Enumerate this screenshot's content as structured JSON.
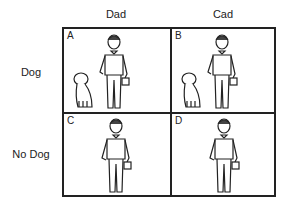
{
  "columns": [
    {
      "label": "Dad"
    },
    {
      "label": "Cad"
    }
  ],
  "rows": [
    {
      "label": "Dog"
    },
    {
      "label": "No Dog"
    }
  ],
  "cells": [
    {
      "letter": "A",
      "column": "Dad",
      "row": "Dog",
      "has_dog": true
    },
    {
      "letter": "B",
      "column": "Cad",
      "row": "Dog",
      "has_dog": true
    },
    {
      "letter": "C",
      "column": "Dad",
      "row": "No Dog",
      "has_dog": false
    },
    {
      "letter": "D",
      "column": "Cad",
      "row": "No Dog",
      "has_dog": false
    }
  ],
  "colors": {
    "line": "#222222",
    "background": "#ffffff"
  }
}
